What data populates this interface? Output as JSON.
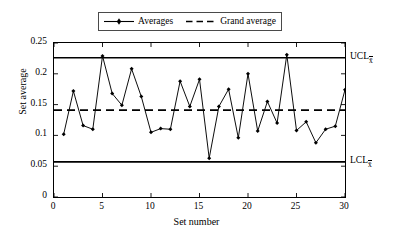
{
  "chart_data": {
    "type": "line",
    "title": "",
    "subtitle": "",
    "xlabel": "Set number",
    "ylabel": "Set average",
    "xlim": [
      0,
      30
    ],
    "ylim": [
      0,
      0.25
    ],
    "xticks": [
      "0",
      "5",
      "10",
      "15",
      "20",
      "25",
      "30"
    ],
    "xtick_values": [
      0,
      5,
      10,
      15,
      20,
      25,
      30
    ],
    "yticks": [
      "0",
      "0.05",
      "0.1",
      "0.15",
      "0.2",
      "0.25"
    ],
    "ytick_values": [
      0,
      0.05,
      0.1,
      0.15,
      0.2,
      0.25
    ],
    "grid": false,
    "legend_position": "top-center",
    "x": [
      1,
      2,
      3,
      4,
      5,
      6,
      7,
      8,
      9,
      10,
      11,
      12,
      13,
      14,
      15,
      16,
      17,
      18,
      19,
      20,
      21,
      22,
      23,
      24,
      25,
      26,
      27,
      28,
      29,
      30
    ],
    "series": [
      {
        "name": "Averages",
        "marker": "diamond",
        "linestyle": "solid",
        "color": "#000000",
        "values": [
          0.102,
          0.172,
          0.116,
          0.11,
          0.229,
          0.168,
          0.149,
          0.208,
          0.163,
          0.105,
          0.111,
          0.11,
          0.188,
          0.147,
          0.191,
          0.063,
          0.147,
          0.175,
          0.096,
          0.2,
          0.107,
          0.155,
          0.12,
          0.231,
          0.108,
          0.122,
          0.088,
          0.11,
          0.115,
          0.174
        ]
      }
    ],
    "reference_lines": [
      {
        "name": "Grand average",
        "label": "Grand average",
        "value": 0.141,
        "linestyle": "dashed",
        "color": "#000000"
      },
      {
        "name": "UCL",
        "label": "UCL",
        "sublabel": "x̄",
        "value": 0.226,
        "linestyle": "solid",
        "color": "#000000"
      },
      {
        "name": "LCL",
        "label": "LCL",
        "sublabel": "x̄",
        "value": 0.057,
        "linestyle": "solid",
        "color": "#000000"
      }
    ],
    "annotations": [
      {
        "text": "UCL",
        "subscript": "x̄",
        "at_y": 0.226
      },
      {
        "text": "LCL",
        "subscript": "x̄",
        "at_y": 0.057
      }
    ]
  },
  "legend": {
    "items": [
      {
        "label": "Averages",
        "style": "line-marker"
      },
      {
        "label": "Grand average",
        "style": "dashed"
      }
    ]
  },
  "axes": {
    "x_label": "Set number",
    "y_label": "Set average"
  },
  "colors": {
    "line": "#000000",
    "frame": "#000000",
    "background": "#ffffff"
  }
}
